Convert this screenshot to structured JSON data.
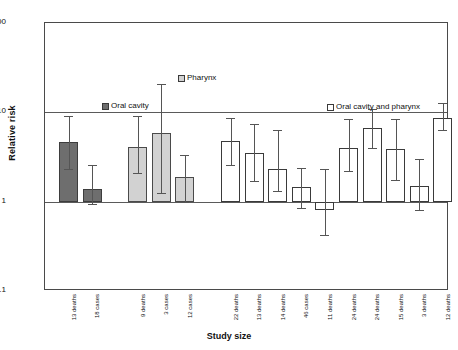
{
  "chart_data": {
    "type": "bar",
    "title": "",
    "xlabel": "Study size",
    "ylabel": "Relative risk",
    "yscale": "log",
    "ylim": [
      0.1,
      100
    ],
    "yticks": [
      "100",
      "10",
      "1",
      "0.1"
    ],
    "ytick_values": [
      100,
      10,
      1,
      0.1
    ],
    "grid": "horizontal gridlines at 10 and 1",
    "legend_position": "inside plot area",
    "legend": [
      {
        "key": "oral",
        "label": "Oral cavity",
        "color": "#6e6e6e"
      },
      {
        "key": "pharynx",
        "label": "Pharynx",
        "color": "#d2d2d2"
      },
      {
        "key": "both",
        "label": "Oral cavity and pharynx",
        "color": "#ffffff"
      }
    ],
    "groups": [
      {
        "name": "Oral cavity",
        "series_key": "oral",
        "points": [
          {
            "category": "13 deaths",
            "value": 4.6,
            "ci_low": 2.3,
            "ci_high": 9.2
          },
          {
            "category": "18 cases",
            "value": 1.4,
            "ci_low": 0.95,
            "ci_high": 2.6
          }
        ]
      },
      {
        "name": "Pharynx",
        "series_key": "pharynx",
        "points": [
          {
            "category": "9 deaths",
            "value": 4.1,
            "ci_low": 2.1,
            "ci_high": 9.0
          },
          {
            "category": "3 cases",
            "value": 5.8,
            "ci_low": 1.25,
            "ci_high": 21.0
          },
          {
            "category": "12 cases",
            "value": 1.9,
            "ci_low": 1.0,
            "ci_high": 3.3
          }
        ]
      },
      {
        "name": "Oral cavity and pharynx",
        "series_key": "both",
        "points": [
          {
            "category": "22 deaths",
            "value": 4.8,
            "ci_low": 2.6,
            "ci_high": 8.7
          },
          {
            "category": "13 deaths",
            "value": 3.5,
            "ci_low": 1.7,
            "ci_high": 7.4
          },
          {
            "category": "14 deaths",
            "value": 2.3,
            "ci_low": 1.3,
            "ci_high": 6.3
          },
          {
            "category": "46 cases",
            "value": 1.45,
            "ci_low": 0.85,
            "ci_high": 2.4
          },
          {
            "category": "11 deaths",
            "value": 0.8,
            "ci_low": 0.42,
            "ci_high": 2.3
          },
          {
            "category": "24 deaths",
            "value": 4.0,
            "ci_low": 2.2,
            "ci_high": 8.4
          },
          {
            "category": "24 deaths",
            "value": 6.6,
            "ci_low": 4.0,
            "ci_high": 10.8
          },
          {
            "category": "15 deaths",
            "value": 3.9,
            "ci_low": 1.75,
            "ci_high": 8.4
          },
          {
            "category": "3 deaths",
            "value": 1.5,
            "ci_low": 0.8,
            "ci_high": 3.0
          },
          {
            "category": "12 deaths",
            "value": 8.6,
            "ci_low": 6.4,
            "ci_high": 12.6
          }
        ]
      }
    ],
    "categories": [
      "13 deaths",
      "18 cases",
      "9 deaths",
      "3 cases",
      "12 cases",
      "22 deaths",
      "13 deaths",
      "14 deaths",
      "46 cases",
      "11 deaths",
      "24 deaths",
      "24 deaths",
      "15 deaths",
      "3 deaths",
      "12 deaths"
    ],
    "values": [
      4.6,
      1.4,
      4.1,
      5.8,
      1.9,
      4.8,
      3.5,
      2.3,
      1.45,
      0.8,
      4.0,
      6.6,
      3.9,
      1.5,
      8.6
    ]
  }
}
